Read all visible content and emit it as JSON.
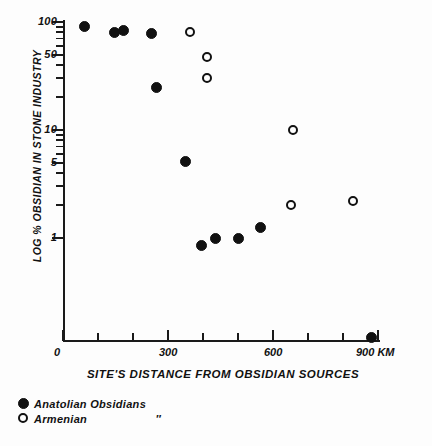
{
  "chart_data": {
    "type": "scatter",
    "title": "",
    "xlabel": "SITE'S DISTANCE FROM OBSIDIAN SOURCES",
    "ylabel": "LOG % OBSIDIAN IN STONE INDUSTRY",
    "yscale": "log",
    "ylim": [
      0.1,
      110
    ],
    "xlim": [
      0,
      900
    ],
    "grid": false,
    "legend_position": "below-axes-left",
    "x_unit": "KM",
    "xticks": [
      0,
      100,
      200,
      300,
      400,
      500,
      600,
      700,
      800,
      900
    ],
    "xticklabels": [
      "0",
      "",
      "",
      "300",
      "",
      "",
      "600",
      "",
      "",
      "900 KM"
    ],
    "xmajorticks": [
      0,
      300,
      600,
      900
    ],
    "yticks": [
      100,
      90,
      80,
      70,
      60,
      50,
      40,
      30,
      20,
      10,
      9,
      8,
      7,
      6,
      5,
      4,
      3,
      2,
      1
    ],
    "ymajorticks": [
      100,
      50,
      10,
      5,
      1
    ],
    "yticklabels": [
      "100",
      "50",
      "10",
      "5",
      "1"
    ],
    "series": [
      {
        "name": "Anatolian Obsidians",
        "marker": "filled-circle",
        "color": "#111111",
        "points": [
          {
            "x": 62,
            "y": 90
          },
          {
            "x": 148,
            "y": 80
          },
          {
            "x": 173,
            "y": 83
          },
          {
            "x": 254,
            "y": 78
          },
          {
            "x": 266,
            "y": 25
          },
          {
            "x": 351,
            "y": 5.1
          },
          {
            "x": 397,
            "y": 0.85
          },
          {
            "x": 437,
            "y": 1.0
          },
          {
            "x": 500,
            "y": 1.0
          },
          {
            "x": 563,
            "y": 1.25
          },
          {
            "x": 880,
            "y": 0.12
          }
        ]
      },
      {
        "name": "Armenian \"",
        "marker": "open-circle",
        "color": "#111111",
        "points": [
          {
            "x": 363,
            "y": 80
          },
          {
            "x": 411,
            "y": 47
          },
          {
            "x": 411,
            "y": 30
          },
          {
            "x": 657,
            "y": 10
          },
          {
            "x": 651,
            "y": 2.0
          },
          {
            "x": 828,
            "y": 2.2
          }
        ]
      }
    ]
  },
  "legend": {
    "entries": [
      {
        "label": "Anatolian Obsidians",
        "ditto": "",
        "marker": "filled-circle"
      },
      {
        "label": "Armenian",
        "ditto": "″",
        "marker": "open-circle"
      }
    ]
  }
}
